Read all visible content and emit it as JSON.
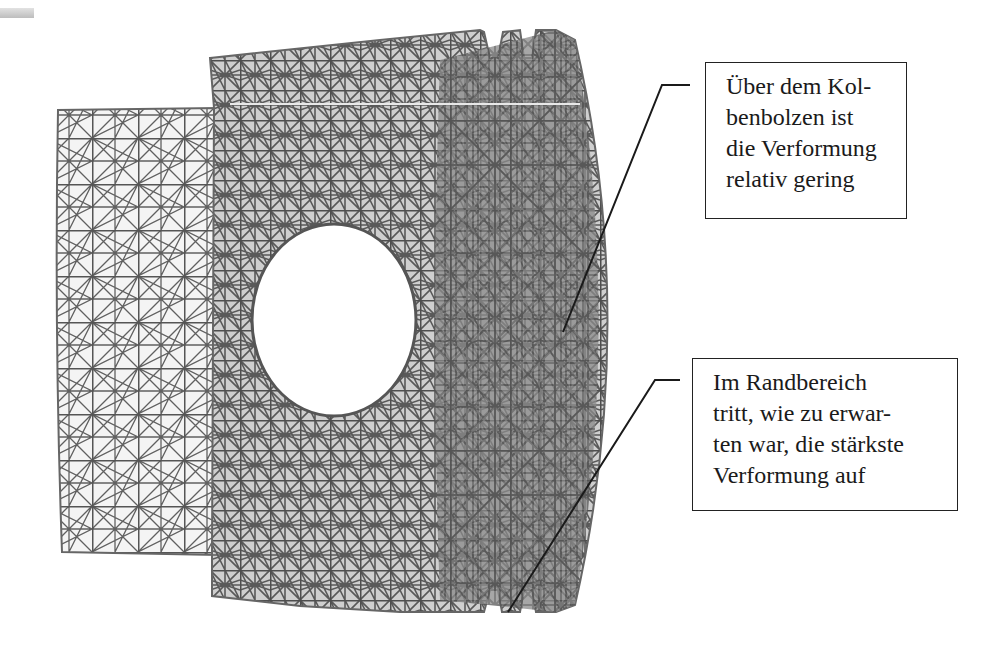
{
  "figure": {
    "mesh_color": "#5f5f5f",
    "leader_color": "#1a1a1a"
  },
  "callouts": [
    {
      "lines": [
        "Über dem Kol-",
        "benbolzen ist",
        "die Verformung",
        "relativ gering"
      ]
    },
    {
      "lines": [
        "Im Randbereich",
        "tritt, wie zu erwar-",
        "ten war, die stärkste",
        "Verformung auf"
      ]
    }
  ]
}
